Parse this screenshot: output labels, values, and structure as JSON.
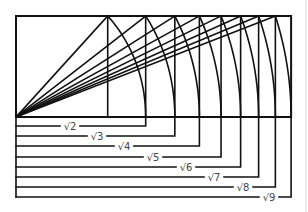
{
  "figure": {
    "construction": {
      "unit_height": 1,
      "n_values": [
        1,
        2,
        3,
        4,
        5,
        6,
        7,
        8,
        9
      ],
      "diagonal_targets": [
        1,
        2,
        3,
        4,
        5,
        6,
        7,
        8
      ],
      "arc_results": [
        2,
        3,
        4,
        5,
        6,
        7,
        8,
        9
      ]
    },
    "brackets": [
      {
        "n": 2,
        "label": "√2"
      },
      {
        "n": 3,
        "label": "√3"
      },
      {
        "n": 4,
        "label": "√4"
      },
      {
        "n": 5,
        "label": "√5"
      },
      {
        "n": 6,
        "label": "√6"
      },
      {
        "n": 7,
        "label": "√7"
      },
      {
        "n": 8,
        "label": "√8"
      },
      {
        "n": 9,
        "label": "√9"
      }
    ],
    "colors": {
      "line": "#111111",
      "label": "#444444",
      "background": "#ffffff"
    }
  }
}
